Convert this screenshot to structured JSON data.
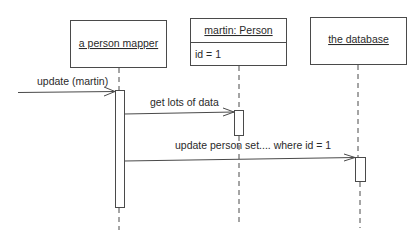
{
  "diagram": {
    "type": "UML sequence diagram",
    "participants": [
      {
        "id": "mapper",
        "label": "a person mapper",
        "attributes": []
      },
      {
        "id": "person",
        "label": "martin: Person",
        "attributes": [
          "id = 1"
        ]
      },
      {
        "id": "db",
        "label": "the database",
        "attributes": []
      }
    ],
    "messages": [
      {
        "from": "external",
        "to": "mapper",
        "label": "update (martin)"
      },
      {
        "from": "mapper",
        "to": "person",
        "label": "get lots of data"
      },
      {
        "from": "mapper",
        "to": "db",
        "label": "update person set.... where id = 1"
      }
    ],
    "colors": {
      "line": "#4a4a4a",
      "text": "#2a2a2a",
      "background": "#ffffff"
    }
  }
}
